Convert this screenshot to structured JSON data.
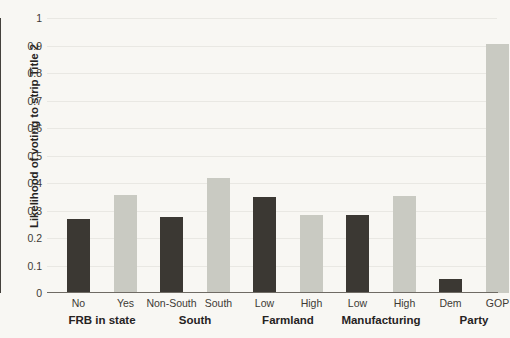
{
  "chart_data": {
    "type": "bar",
    "title": "",
    "subtitle": "",
    "xlabel": "",
    "ylabel": "Likelihood of voting to strip Title 2",
    "ylim": [
      0,
      1
    ],
    "ytick_labels": [
      "1",
      "0.9",
      "0.8",
      "0.7",
      "0.6",
      "0.5",
      "0.4",
      "0.3",
      "0.2",
      "0.1",
      "0"
    ],
    "ytick_values": [
      1,
      0.9,
      0.8,
      0.7,
      0.6,
      0.5,
      0.4,
      0.3,
      0.2,
      0.1,
      0
    ],
    "grid": true,
    "legend": "none",
    "categories": [
      "No",
      "Yes",
      "Non-South",
      "South",
      "Low",
      "High",
      "Low",
      "High",
      "Dem",
      "GOP"
    ],
    "values": [
      0.268,
      0.357,
      0.277,
      0.42,
      0.35,
      0.282,
      0.285,
      0.353,
      0.05,
      0.905
    ],
    "bar_shades": [
      "dark",
      "light",
      "dark",
      "light",
      "dark",
      "light",
      "dark",
      "light",
      "dark",
      "light"
    ],
    "groups": [
      {
        "label": "FRB in state",
        "categories": [
          "No",
          "Yes"
        ],
        "values": [
          0.268,
          0.357
        ]
      },
      {
        "label": "South",
        "categories": [
          "Non-South",
          "South"
        ],
        "values": [
          0.277,
          0.42
        ]
      },
      {
        "label": "Farmland",
        "categories": [
          "Low",
          "High"
        ],
        "values": [
          0.35,
          0.282
        ]
      },
      {
        "label": "Manufacturing",
        "categories": [
          "Low",
          "High"
        ],
        "values": [
          0.285,
          0.353
        ]
      },
      {
        "label": "Party",
        "categories": [
          "Dem",
          "GOP"
        ],
        "values": [
          0.05,
          0.905
        ]
      }
    ],
    "colors": {
      "dark_bar": "#3b3833",
      "light_bar": "#c9cac2",
      "gridline": "#e9e8e3",
      "axis": "#44413c",
      "background": "#f8f7f3",
      "text": "#26231f"
    }
  }
}
